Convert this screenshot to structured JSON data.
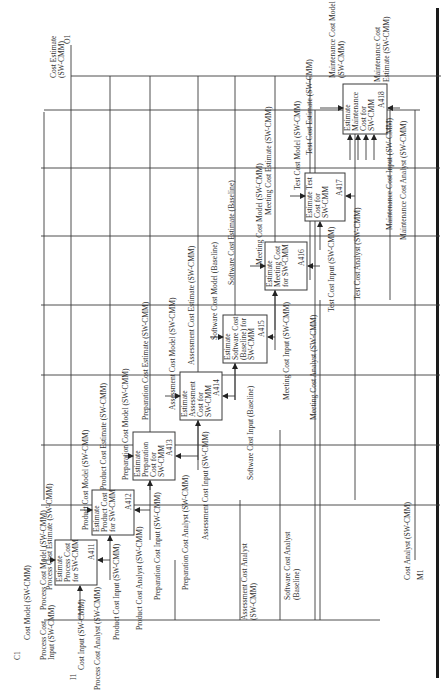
{
  "diagram": {
    "type": "IDEF0",
    "orientation": "rotated-90-ccw",
    "boundary": {
      "C1": "C1",
      "I1": "I1",
      "O1": "O1",
      "M1": "M1",
      "control_in": "Cost Model (SW-CMM)",
      "input_in": "Cost Input (SW-CMM)",
      "output_out": "Cost Estimate (SW-CMM)",
      "output_out_l1": "Cost Estimate",
      "output_out_l2": "(SW-CMM)",
      "mechanism_in": "Cost Analyst (SW-CMM)"
    },
    "activities": [
      {
        "id": "A411",
        "l1": "Estimate",
        "l2": "Process Cost",
        "l3": "for SW-CMM",
        "l4": ""
      },
      {
        "id": "A412",
        "l1": "Estimate",
        "l2": "Product Cost",
        "l3": "for SW-CMM",
        "l4": ""
      },
      {
        "id": "A413",
        "l1": "Estimate",
        "l2": "Preparation",
        "l3": "Cost for",
        "l4": "SW-CMM"
      },
      {
        "id": "A414",
        "l1": "Estimate",
        "l2": "Assessment",
        "l3": "Cost for",
        "l4": "SW-CMM"
      },
      {
        "id": "A415",
        "l1": "Estimate",
        "l2": "Software Cost",
        "l3": "(Baseline) for",
        "l4": "SW-CMM"
      },
      {
        "id": "A416",
        "l1": "Estimate",
        "l2": "Meeting Cost",
        "l3": "for SW-CMM",
        "l4": ""
      },
      {
        "id": "A417",
        "l1": "Estimate Test",
        "l2": "Cost for",
        "l3": "SW-CMM",
        "l4": ""
      },
      {
        "id": "A418",
        "l1": "Estimate",
        "l2": "Maintenance",
        "l3": "Cost for",
        "l4": "SW-CMM"
      }
    ],
    "arrows": {
      "process_cost_model": "Process Cost Model (SW-CMM)",
      "process_cost_estimate": "Process Cost Estimate (SW-CMM)",
      "process_cost_input_l1": "Process Cost",
      "process_cost_input_l2": "Input (SW-CMM)",
      "process_cost_analyst": "Process Cost Analyst (SW-CMM)",
      "product_cost_model": "Product Cost Model (SW-CMM)",
      "product_cost_estimate": "Product Cost Estimate (SW-CMM)",
      "product_cost_input": "Product Cost Input (SW-CMM)",
      "product_cost_analyst": "Product Cost Analyst (SW-CMM)",
      "preparation_cost_model": "Preparation Cost Model (SW-CMM)",
      "preparation_cost_estimate": "Preparation Cost Estimate (SW-CMM)",
      "preparation_cost_input": "Preparation Cost Input (SW-CMM)",
      "preparation_cost_analyst": "Preparation Cost Analyst (SW-CMM)",
      "assessment_cost_model": "Assessment Cost Model (SW-CMM)",
      "assessment_cost_estimate": "Assessment Cost Estimate (SW-CMM)",
      "assessment_cost_input": "Assessment Cost Input (SW-CMM)",
      "assessment_cost_analyst_l1": "Assessment Cost Analyst",
      "assessment_cost_analyst_l2": "(SW-CMM)",
      "software_cost_model": "Software Cost Model (Baseline)",
      "software_cost_estimate": "Software Cost Estimate (Baseline)",
      "software_cost_input": "Software Cost Input (Baseline)",
      "software_cost_analyst_l1": "Software Cost Analyst",
      "software_cost_analyst_l2": "(Baseline)",
      "meeting_cost_model": "Meeting Cost Model (SW-CMM)",
      "meeting_cost_estimate": "Meeting Cost Estimate (SW-CMM)",
      "meeting_cost_input": "Meeting Cost Input (SW-CMM)",
      "meeting_cost_analyst": "Meeting Cost Analyst (SW-CMM)",
      "test_cost_model": "Test Cost Model (SW-CMM)",
      "test_cost_estimate": "Test Cost Estimate (SW-CMM)",
      "test_cost_input": "Test Cost Input (SW-CMM)",
      "test_cost_analyst": "Test Cost Analyst (SW-CMM)",
      "maintenance_cost_model_l1": "Maintenance Cost Model",
      "maintenance_cost_model_l2": "(SW-CMM)",
      "maintenance_cost_estimate_l1": "Maintenance Cost",
      "maintenance_cost_estimate_l2": "Estimate (SW-CMM)",
      "maintenance_cost_input": "Maintenance Cost Input (SW-CMM)",
      "maintenance_cost_analyst": "Maintenance Cost Analyst (SW-CMM)"
    }
  }
}
